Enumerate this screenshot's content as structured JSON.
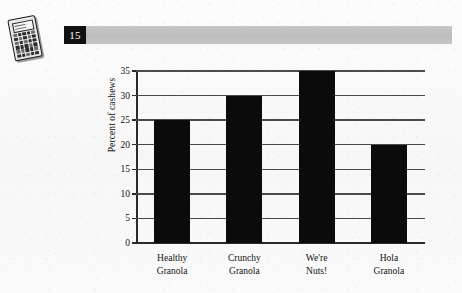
{
  "page": {
    "number_label": "15",
    "calculator_icon": "calculator-icon"
  },
  "chart_data": {
    "type": "bar",
    "title": "",
    "xlabel": "",
    "ylabel": "Percent of cashews",
    "categories": [
      "Healthy Granola",
      "Crunchy Granola",
      "We're Nuts!",
      "Hola Granola"
    ],
    "category_lines": [
      [
        "Healthy",
        "Granola"
      ],
      [
        "Crunchy",
        "Granola"
      ],
      [
        "We're",
        "Nuts!"
      ],
      [
        "Hola",
        "Granola"
      ]
    ],
    "values": [
      25,
      30,
      35,
      20
    ],
    "ylim": [
      0,
      35
    ],
    "ytick_labels": [
      "0",
      "5",
      "10",
      "15",
      "20",
      "25",
      "30",
      "35"
    ],
    "ytick_values": [
      0,
      5,
      10,
      15,
      20,
      25,
      30,
      35
    ],
    "grid": true,
    "legend": "none",
    "bar_color": "#0b0b0b",
    "axis_color": "#2a2a2a",
    "grid_color": "#4a4a4a"
  }
}
